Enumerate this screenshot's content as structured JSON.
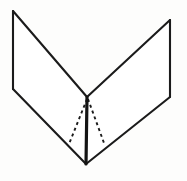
{
  "figure": {
    "background_color": "#fdfdfc",
    "line_color": "#1b1b1b",
    "fold_line_color": "#141414",
    "canvas": {
      "width": 187,
      "height": 181
    },
    "vertices": {
      "top_left": {
        "x": 13,
        "y": 11
      },
      "left_lower": {
        "x": 13,
        "y": 89
      },
      "top_right": {
        "x": 170,
        "y": 20
      },
      "right_lower": {
        "x": 170,
        "y": 97
      },
      "center_apex": {
        "x": 87,
        "y": 97
      },
      "bottom_vertex": {
        "x": 86,
        "y": 164
      }
    },
    "panels": [
      {
        "name": "left-panel",
        "points": "13,11 87,97 86,164 13,89"
      },
      {
        "name": "right-panel",
        "points": "170,20 170,97 86,164 87,97"
      }
    ],
    "solid_edges": [
      {
        "name": "left-top-edge",
        "path": "M 13 11 L 87 97"
      },
      {
        "name": "left-vertical-edge",
        "path": "M 13 11 L 13 89"
      },
      {
        "name": "left-bottom-edge",
        "path": "M 13 89 L 86 164"
      },
      {
        "name": "right-top-edge",
        "path": "M 87 97 L 170 20"
      },
      {
        "name": "right-vertical-edge",
        "path": "M 170 20 L 170 97"
      },
      {
        "name": "right-bottom-edge",
        "path": "M 170 97 L 86 164"
      }
    ],
    "fold_line": {
      "name": "center-fold",
      "path": "M 87 97 L 86 164"
    },
    "dashed_lines": [
      {
        "name": "left-dashed-guide",
        "path": "M 87 99 L 69 144"
      },
      {
        "name": "right-dashed-guide",
        "path": "M 88 99 L 104 143"
      }
    ]
  }
}
